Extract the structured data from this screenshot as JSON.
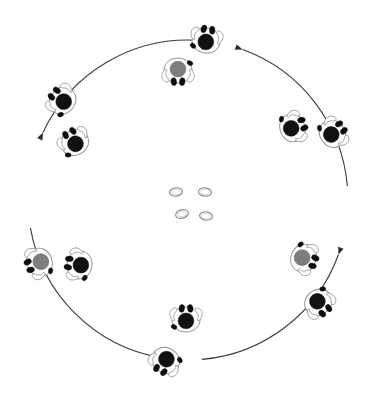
{
  "figure": {
    "canvas": {
      "width": 374,
      "height": 401,
      "background": "#ffffff"
    },
    "center": {
      "x": 188,
      "y": 200
    },
    "colors": {
      "arc_stroke": "#3a3a3a",
      "arrowhead": "#2b2b2b",
      "body_outline": "#8c8c8c",
      "head_dark": "#111111",
      "head_gray": "#7d7d7d",
      "foot_dark": "#0d0d0d",
      "ring_stroke": "#8f8f8f"
    }
  },
  "diagram_data": {
    "type": "radial-arrangement",
    "description": "Twelve overhead-view humanoid figures placed around a large circle, with four curved arrows indicating clockwise circulation, and four small rings at the centre.",
    "ring_radius": 160,
    "figure_count": 12,
    "arrow_count": 4,
    "center_object_count": 4,
    "rotation_direction": "clockwise",
    "figures": [
      {
        "id": "figure-1",
        "label": "top",
        "x": 206,
        "y": 41,
        "rot": 190,
        "head": "dark",
        "ring": "outer"
      },
      {
        "id": "figure-2",
        "label": "top-inner",
        "x": 178,
        "y": 70,
        "rot": 0,
        "head": "gray",
        "ring": "inner"
      },
      {
        "id": "figure-3",
        "label": "upper-right",
        "x": 292,
        "y": 128,
        "rot": 250,
        "head": "dark",
        "ring": "inner"
      },
      {
        "id": "figure-4",
        "label": "right-upper",
        "x": 332,
        "y": 134,
        "rot": 235,
        "head": "dark",
        "ring": "outer"
      },
      {
        "id": "figure-5",
        "label": "right-inner",
        "x": 303,
        "y": 258,
        "rot": 290,
        "head": "gray",
        "ring": "inner"
      },
      {
        "id": "figure-6",
        "label": "lower-right",
        "x": 318,
        "y": 302,
        "rot": 320,
        "head": "dark",
        "ring": "outer"
      },
      {
        "id": "figure-7",
        "label": "bottom-inner",
        "x": 186,
        "y": 320,
        "rot": 180,
        "head": "dark",
        "ring": "inner"
      },
      {
        "id": "figure-8",
        "label": "bottom",
        "x": 166,
        "y": 360,
        "rot": 30,
        "head": "dark",
        "ring": "outer"
      },
      {
        "id": "figure-9",
        "label": "lower-left",
        "x": 40,
        "y": 262,
        "rot": 70,
        "head": "gray",
        "ring": "outer"
      },
      {
        "id": "figure-10",
        "label": "left-inner",
        "x": 80,
        "y": 265,
        "rot": 100,
        "head": "dark",
        "ring": "inner"
      },
      {
        "id": "figure-11",
        "label": "upper-left",
        "x": 63,
        "y": 101,
        "rot": 130,
        "head": "dark",
        "ring": "outer"
      },
      {
        "id": "figure-12",
        "label": "left-inner-top",
        "x": 75,
        "y": 143,
        "rot": 150,
        "head": "dark",
        "ring": "inner"
      }
    ],
    "arrows": [
      {
        "id": "arrow-top-right",
        "from_angle": 205,
        "to_angle": 275,
        "direction": "clockwise",
        "tip_x": 205,
        "tip_y": 38
      },
      {
        "id": "arrow-right-bottom",
        "from_angle": 290,
        "to_angle": 355,
        "direction": "clockwise",
        "tip_x": 320,
        "tip_y": 294
      },
      {
        "id": "arrow-bottom-left",
        "from_angle": 20,
        "to_angle": 85,
        "direction": "clockwise",
        "tip_x": 185,
        "tip_y": 365
      },
      {
        "id": "arrow-left-top",
        "from_angle": 100,
        "to_angle": 170,
        "direction": "clockwise",
        "tip_x": 47,
        "tip_y": 117
      }
    ],
    "center_rings": [
      {
        "id": "ring-1",
        "x": 176,
        "y": 192,
        "rx": 6.5,
        "ry": 4.2,
        "rot": -8
      },
      {
        "id": "ring-2",
        "x": 205,
        "y": 192,
        "rx": 6.5,
        "ry": 4.2,
        "rot": 6
      },
      {
        "id": "ring-3",
        "x": 182,
        "y": 214,
        "rx": 6.5,
        "ry": 4.2,
        "rot": -14
      },
      {
        "id": "ring-4",
        "x": 206,
        "y": 216,
        "rx": 6.5,
        "ry": 4.2,
        "rot": 8
      }
    ]
  }
}
